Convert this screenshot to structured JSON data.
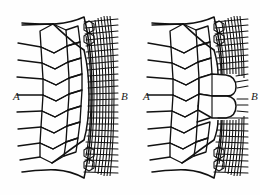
{
  "figure": {
    "background_color": "#fefefe",
    "line_color": "#111111",
    "panels": [
      {
        "id": "panel-left",
        "name": "panel-a-undisturbed",
        "label_left": "A",
        "label_right": "B",
        "description": "Uniform transition from large hexagonal cells at A to dense narrow cells at B"
      },
      {
        "id": "panel-right",
        "name": "panel-b-intrusion",
        "label_left": "A",
        "label_right": "B",
        "description": "Large cells form a tongue intruding horizontally into the dense fine-celled zone"
      }
    ],
    "labels": {
      "left_side": "A",
      "right_side": "B"
    }
  }
}
